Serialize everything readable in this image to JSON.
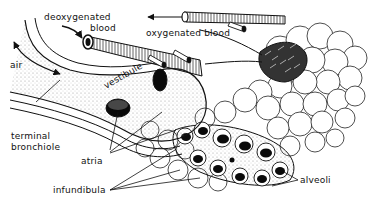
{
  "diagram": {
    "labels": {
      "deoxygenated": "deoxygenated",
      "blood1": "blood",
      "oxygenated_blood": "oxygenated blood",
      "air": "air",
      "vestibule": "vestibule",
      "terminal": "terminal",
      "bronchiole": "bronchiole",
      "atria": "atria",
      "infundibula": "infundibula",
      "alveoli": "alveoli"
    },
    "colors": {
      "ink": "#111111",
      "background": "#ffffff",
      "stipple": "#9a9a9a"
    }
  }
}
